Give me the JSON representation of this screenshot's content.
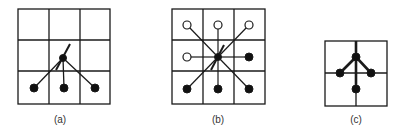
{
  "figure": {
    "panels": [
      {
        "id": "a",
        "label": "(a)",
        "grid": "3x3",
        "center": "center-cell node",
        "neighbors_filled": [
          "bottom-left",
          "bottom",
          "bottom-right"
        ],
        "neighbors_open": []
      },
      {
        "id": "b",
        "label": "(b)",
        "grid": "3x3",
        "center": "center-cell node",
        "neighbors_filled": [
          "right",
          "bottom-left",
          "bottom",
          "bottom-right"
        ],
        "neighbors_open": [
          "top-left",
          "top",
          "top-right",
          "left"
        ]
      },
      {
        "id": "c",
        "label": "(c)",
        "grid": "2x2",
        "center": "upper node on vertical line",
        "neighbors_filled": [
          "left",
          "right",
          "bottom"
        ],
        "neighbors_open": []
      }
    ]
  },
  "colors": {
    "line": "#1a1a1a",
    "filled_node": "#111111",
    "open_node": "#ffffff"
  }
}
